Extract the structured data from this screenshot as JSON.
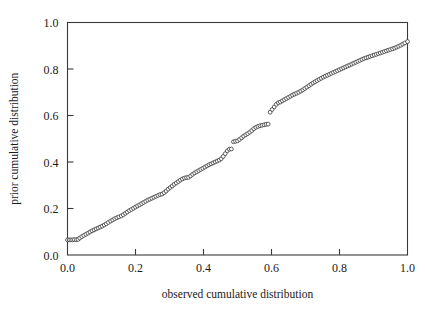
{
  "chart_data": {
    "type": "scatter",
    "title": "",
    "xlabel": "observed cumulative distribution",
    "ylabel": "prior cumulative distribution",
    "xlim": [
      0.0,
      1.0
    ],
    "ylim": [
      0.0,
      1.0
    ],
    "xticks": [
      "0.0",
      "0.2",
      "0.4",
      "0.6",
      "0.8",
      "1.0"
    ],
    "yticks": [
      "0.0",
      "0.2",
      "0.4",
      "0.6",
      "0.8",
      "1.0"
    ],
    "xtick_values": [
      0.0,
      0.2,
      0.4,
      0.6,
      0.8,
      1.0
    ],
    "ytick_values": [
      0.0,
      0.2,
      0.4,
      0.6,
      0.8,
      1.0
    ],
    "grid": false,
    "legend": null,
    "marker": "open-circle",
    "marker_color": "#404040",
    "marker_fill": "#ffffff",
    "series": [
      {
        "name": "prior vs observed",
        "x": [
          0.0,
          0.005,
          0.01,
          0.015,
          0.02,
          0.026,
          0.031,
          0.036,
          0.042,
          0.048,
          0.054,
          0.06,
          0.066,
          0.072,
          0.078,
          0.084,
          0.09,
          0.096,
          0.102,
          0.108,
          0.114,
          0.12,
          0.127,
          0.133,
          0.139,
          0.145,
          0.151,
          0.158,
          0.164,
          0.17,
          0.176,
          0.182,
          0.188,
          0.194,
          0.2,
          0.206,
          0.212,
          0.218,
          0.224,
          0.23,
          0.236,
          0.242,
          0.248,
          0.254,
          0.26,
          0.266,
          0.272,
          0.278,
          0.284,
          0.29,
          0.296,
          0.302,
          0.308,
          0.314,
          0.32,
          0.326,
          0.332,
          0.338,
          0.344,
          0.35,
          0.356,
          0.362,
          0.368,
          0.374,
          0.38,
          0.386,
          0.392,
          0.398,
          0.404,
          0.41,
          0.416,
          0.422,
          0.428,
          0.434,
          0.44,
          0.446,
          0.452,
          0.458,
          0.464,
          0.47,
          0.476,
          0.482,
          0.488,
          0.494,
          0.5,
          0.506,
          0.512,
          0.518,
          0.524,
          0.53,
          0.536,
          0.542,
          0.548,
          0.554,
          0.56,
          0.566,
          0.572,
          0.578,
          0.584,
          0.59,
          0.596,
          0.602,
          0.608,
          0.614,
          0.62,
          0.626,
          0.632,
          0.638,
          0.644,
          0.65,
          0.656,
          0.662,
          0.668,
          0.674,
          0.68,
          0.686,
          0.692,
          0.698,
          0.704,
          0.71,
          0.716,
          0.722,
          0.728,
          0.734,
          0.74,
          0.746,
          0.752,
          0.758,
          0.764,
          0.77,
          0.776,
          0.782,
          0.788,
          0.794,
          0.8,
          0.806,
          0.812,
          0.818,
          0.824,
          0.83,
          0.836,
          0.842,
          0.848,
          0.854,
          0.86,
          0.866,
          0.872,
          0.878,
          0.884,
          0.89,
          0.896,
          0.902,
          0.908,
          0.914,
          0.92,
          0.926,
          0.932,
          0.938,
          0.944,
          0.95,
          0.956,
          0.962,
          0.968,
          0.974,
          0.98,
          0.986,
          0.992,
          1.0
        ],
        "y": [
          0.065,
          0.065,
          0.065,
          0.065,
          0.066,
          0.066,
          0.067,
          0.073,
          0.079,
          0.084,
          0.089,
          0.094,
          0.099,
          0.104,
          0.108,
          0.112,
          0.116,
          0.12,
          0.124,
          0.129,
          0.134,
          0.14,
          0.146,
          0.151,
          0.156,
          0.16,
          0.164,
          0.168,
          0.173,
          0.179,
          0.185,
          0.191,
          0.196,
          0.201,
          0.206,
          0.211,
          0.216,
          0.221,
          0.226,
          0.231,
          0.236,
          0.24,
          0.244,
          0.248,
          0.252,
          0.256,
          0.26,
          0.262,
          0.268,
          0.275,
          0.283,
          0.29,
          0.297,
          0.304,
          0.31,
          0.316,
          0.322,
          0.327,
          0.331,
          0.333,
          0.334,
          0.34,
          0.347,
          0.353,
          0.358,
          0.363,
          0.368,
          0.373,
          0.378,
          0.383,
          0.388,
          0.392,
          0.396,
          0.4,
          0.404,
          0.408,
          0.414,
          0.424,
          0.436,
          0.448,
          0.455,
          0.456,
          0.487,
          0.489,
          0.491,
          0.497,
          0.504,
          0.511,
          0.517,
          0.522,
          0.528,
          0.535,
          0.543,
          0.549,
          0.553,
          0.556,
          0.558,
          0.56,
          0.562,
          0.563,
          0.614,
          0.626,
          0.637,
          0.648,
          0.655,
          0.658,
          0.663,
          0.668,
          0.673,
          0.678,
          0.683,
          0.688,
          0.692,
          0.696,
          0.7,
          0.705,
          0.71,
          0.716,
          0.722,
          0.728,
          0.734,
          0.74,
          0.745,
          0.75,
          0.755,
          0.76,
          0.765,
          0.769,
          0.773,
          0.777,
          0.781,
          0.785,
          0.789,
          0.793,
          0.797,
          0.801,
          0.805,
          0.809,
          0.813,
          0.817,
          0.821,
          0.825,
          0.829,
          0.833,
          0.837,
          0.841,
          0.845,
          0.848,
          0.851,
          0.854,
          0.857,
          0.86,
          0.863,
          0.866,
          0.869,
          0.872,
          0.875,
          0.878,
          0.881,
          0.884,
          0.887,
          0.89,
          0.894,
          0.898,
          0.902,
          0.907,
          0.912,
          0.918
        ]
      }
    ]
  }
}
